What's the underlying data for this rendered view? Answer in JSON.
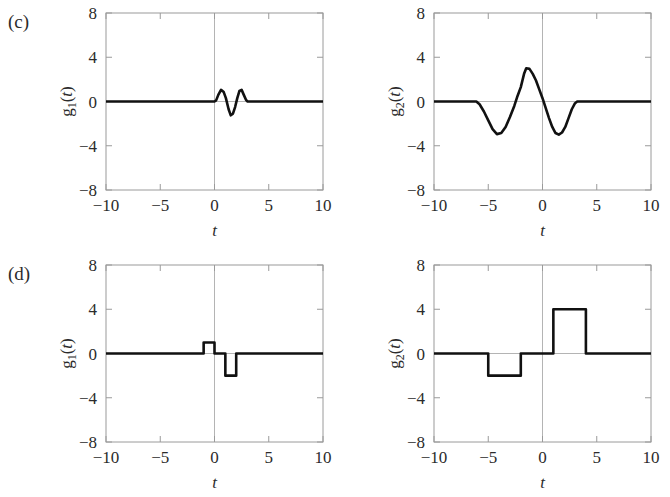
{
  "figure": {
    "background": "#ffffff",
    "curve_color": "#111111",
    "frame_color": "#9a9a9a",
    "zero_line_color": "#b4b4b4",
    "panels": [
      {
        "tag": "(c)",
        "plots": [
          {
            "id": "c-left",
            "ylabel_base": "g",
            "ylabel_sub": "1",
            "ylabel_arg": "(t)",
            "xlabel": "t",
            "box": {
              "x": 106,
              "y": 13,
              "w": 217,
              "h": 177
            },
            "tag_pos": {
              "x": 8,
              "y": 28
            },
            "chart_data": {
              "type": "line",
              "title": "",
              "xlabel": "t",
              "ylabel": "g1(t)",
              "xlim": [
                -10,
                10
              ],
              "ylim": [
                -8,
                8
              ],
              "xticks": [
                -10,
                -5,
                0,
                5,
                10
              ],
              "yticks": [
                -8,
                -4,
                0,
                4,
                8
              ],
              "xticklabels": [
                "−10",
                "−5",
                "0",
                "5",
                "10"
              ],
              "yticklabels": [
                "−8",
                "−4",
                "0",
                "4",
                "8"
              ],
              "grid": false,
              "legend": "none",
              "series": [
                {
                  "name": "g1(t)",
                  "points": [
                    [
                      -10,
                      0
                    ],
                    [
                      -1,
                      0
                    ],
                    [
                      -0.4,
                      0
                    ],
                    [
                      0,
                      0
                    ],
                    [
                      0.15,
                      0.1
                    ],
                    [
                      0.35,
                      0.6
                    ],
                    [
                      0.6,
                      1.05
                    ],
                    [
                      0.85,
                      0.85
                    ],
                    [
                      1.05,
                      0.3
                    ],
                    [
                      1.3,
                      -0.7
                    ],
                    [
                      1.5,
                      -1.25
                    ],
                    [
                      1.7,
                      -1.1
                    ],
                    [
                      1.9,
                      -0.5
                    ],
                    [
                      2.1,
                      0.3
                    ],
                    [
                      2.3,
                      0.95
                    ],
                    [
                      2.5,
                      1.05
                    ],
                    [
                      2.7,
                      0.6
                    ],
                    [
                      2.9,
                      0.15
                    ],
                    [
                      3.05,
                      0
                    ],
                    [
                      5,
                      0
                    ],
                    [
                      10,
                      0
                    ]
                  ]
                }
              ]
            }
          },
          {
            "id": "c-right",
            "ylabel_base": "g",
            "ylabel_sub": "2",
            "ylabel_arg": "(t)",
            "xlabel": "t",
            "box": {
              "x": 434,
              "y": 13,
              "w": 217,
              "h": 177
            },
            "chart_data": {
              "type": "line",
              "title": "",
              "xlabel": "t",
              "ylabel": "g2(t)",
              "xlim": [
                -10,
                10
              ],
              "ylim": [
                -8,
                8
              ],
              "xticks": [
                -10,
                -5,
                0,
                5,
                10
              ],
              "yticks": [
                -8,
                -4,
                0,
                4,
                8
              ],
              "xticklabels": [
                "−10",
                "−5",
                "0",
                "5",
                "10"
              ],
              "yticklabels": [
                "−8",
                "−4",
                "0",
                "4",
                "8"
              ],
              "grid": false,
              "legend": "none",
              "series": [
                {
                  "name": "g2(t)",
                  "points": [
                    [
                      -10,
                      0
                    ],
                    [
                      -6.1,
                      0
                    ],
                    [
                      -5.8,
                      -0.25
                    ],
                    [
                      -5.4,
                      -0.9
                    ],
                    [
                      -5.0,
                      -1.7
                    ],
                    [
                      -4.6,
                      -2.5
                    ],
                    [
                      -4.2,
                      -2.95
                    ],
                    [
                      -3.8,
                      -2.85
                    ],
                    [
                      -3.4,
                      -2.3
                    ],
                    [
                      -3.0,
                      -1.4
                    ],
                    [
                      -2.6,
                      -0.4
                    ],
                    [
                      -2.3,
                      0.5
                    ],
                    [
                      -2.0,
                      1.3
                    ],
                    [
                      -1.7,
                      2.5
                    ],
                    [
                      -1.5,
                      3.0
                    ],
                    [
                      -1.2,
                      2.95
                    ],
                    [
                      -0.9,
                      2.5
                    ],
                    [
                      -0.6,
                      1.9
                    ],
                    [
                      -0.3,
                      1.1
                    ],
                    [
                      0,
                      0.3
                    ],
                    [
                      0.3,
                      -0.6
                    ],
                    [
                      0.6,
                      -1.5
                    ],
                    [
                      0.9,
                      -2.3
                    ],
                    [
                      1.2,
                      -2.85
                    ],
                    [
                      1.5,
                      -3.0
                    ],
                    [
                      1.8,
                      -2.8
                    ],
                    [
                      2.1,
                      -2.3
                    ],
                    [
                      2.4,
                      -1.5
                    ],
                    [
                      2.7,
                      -0.7
                    ],
                    [
                      3.0,
                      -0.15
                    ],
                    [
                      3.2,
                      0
                    ],
                    [
                      5,
                      0
                    ],
                    [
                      10,
                      0
                    ]
                  ]
                }
              ]
            }
          }
        ]
      },
      {
        "tag": "(d)",
        "plots": [
          {
            "id": "d-left",
            "ylabel_base": "g",
            "ylabel_sub": "1",
            "ylabel_arg": "(t)",
            "xlabel": "t",
            "box": {
              "x": 106,
              "y": 265,
              "w": 217,
              "h": 177
            },
            "tag_pos": {
              "x": 8,
              "y": 280
            },
            "chart_data": {
              "type": "line",
              "title": "",
              "xlabel": "t",
              "ylabel": "g1(t)",
              "xlim": [
                -10,
                10
              ],
              "ylim": [
                -8,
                8
              ],
              "xticks": [
                -10,
                -5,
                0,
                5,
                10
              ],
              "yticks": [
                -8,
                -4,
                0,
                4,
                8
              ],
              "xticklabels": [
                "−10",
                "−5",
                "0",
                "5",
                "10"
              ],
              "yticklabels": [
                "−8",
                "−4",
                "0",
                "4",
                "8"
              ],
              "grid": false,
              "legend": "none",
              "series": [
                {
                  "name": "g1(t)",
                  "points": [
                    [
                      -10,
                      0
                    ],
                    [
                      -1,
                      0
                    ],
                    [
                      -1,
                      1
                    ],
                    [
                      0,
                      1
                    ],
                    [
                      0,
                      0
                    ],
                    [
                      1,
                      0
                    ],
                    [
                      1,
                      -2
                    ],
                    [
                      2,
                      -2
                    ],
                    [
                      2,
                      0
                    ],
                    [
                      10,
                      0
                    ]
                  ]
                }
              ]
            }
          },
          {
            "id": "d-right",
            "ylabel_base": "g",
            "ylabel_sub": "2",
            "ylabel_arg": "(t)",
            "xlabel": "t",
            "box": {
              "x": 434,
              "y": 265,
              "w": 217,
              "h": 177
            },
            "chart_data": {
              "type": "line",
              "title": "",
              "xlabel": "t",
              "ylabel": "g2(t)",
              "xlim": [
                -10,
                10
              ],
              "ylim": [
                -8,
                8
              ],
              "xticks": [
                -10,
                -5,
                0,
                5,
                10
              ],
              "yticks": [
                -8,
                -4,
                0,
                4,
                8
              ],
              "xticklabels": [
                "−10",
                "−5",
                "0",
                "5",
                "10"
              ],
              "yticklabels": [
                "−8",
                "−4",
                "0",
                "4",
                "8"
              ],
              "grid": false,
              "legend": "none",
              "series": [
                {
                  "name": "g2(t)",
                  "points": [
                    [
                      -10,
                      0
                    ],
                    [
                      -5,
                      0
                    ],
                    [
                      -5,
                      -2
                    ],
                    [
                      -2,
                      -2
                    ],
                    [
                      -2,
                      0
                    ],
                    [
                      1,
                      0
                    ],
                    [
                      1,
                      4
                    ],
                    [
                      4,
                      4
                    ],
                    [
                      4,
                      0
                    ],
                    [
                      10,
                      0
                    ]
                  ]
                }
              ]
            }
          }
        ]
      }
    ]
  },
  "chart_data": [
    {
      "type": "line",
      "panel": "(c)",
      "name": "g1(t) modulated pulse",
      "title": "",
      "xlabel": "t",
      "ylabel": "g1(t)",
      "xlim": [
        -10,
        10
      ],
      "ylim": [
        -8,
        8
      ],
      "xticks": [
        -10,
        -5,
        0,
        5,
        10
      ],
      "yticks": [
        -8,
        -4,
        0,
        4,
        8
      ],
      "grid": false,
      "legend": "none",
      "description": "Zero everywhere except a short oscillation between t=0 and t=3: peak +1 near t=0.6, trough -1.25 near t=1.5, peak +1 near t=2.5.",
      "x": [
        -10,
        0,
        0.6,
        1.5,
        2.5,
        3,
        10
      ],
      "y": [
        0,
        0,
        1.05,
        -1.25,
        1.05,
        0,
        0
      ]
    },
    {
      "type": "line",
      "panel": "(c)",
      "name": "g2(t) modulated pulse",
      "title": "",
      "xlabel": "t",
      "ylabel": "g2(t)",
      "xlim": [
        -10,
        10
      ],
      "ylim": [
        -8,
        8
      ],
      "xticks": [
        -10,
        -5,
        0,
        5,
        10
      ],
      "yticks": [
        -8,
        -4,
        0,
        4,
        8
      ],
      "grid": false,
      "legend": "none",
      "description": "Zero until t=-6, trough -3 near t=-4.2, peak +3 near t=-1.5, trough -3 near t=1.5, back to zero at t=3.2.",
      "x": [
        -10,
        -6,
        -4.2,
        -1.5,
        1.5,
        3.2,
        10
      ],
      "y": [
        0,
        0,
        -3,
        3,
        -3,
        0,
        0
      ]
    },
    {
      "type": "line",
      "panel": "(d)",
      "name": "g1(t) rectangular pulses",
      "title": "",
      "xlabel": "t",
      "ylabel": "g1(t)",
      "xlim": [
        -10,
        10
      ],
      "ylim": [
        -8,
        8
      ],
      "xticks": [
        -10,
        -5,
        0,
        5,
        10
      ],
      "yticks": [
        -8,
        -4,
        0,
        4,
        8
      ],
      "grid": false,
      "legend": "none",
      "description": "Piecewise constant: 0 for t<-1, +1 for -1<t<0, 0 for 0<t<1, -2 for 1<t<2, 0 for t>2.",
      "segments": [
        {
          "from": -10,
          "to": -1,
          "value": 0
        },
        {
          "from": -1,
          "to": 0,
          "value": 1
        },
        {
          "from": 0,
          "to": 1,
          "value": 0
        },
        {
          "from": 1,
          "to": 2,
          "value": -2
        },
        {
          "from": 2,
          "to": 10,
          "value": 0
        }
      ]
    },
    {
      "type": "line",
      "panel": "(d)",
      "name": "g2(t) rectangular pulses",
      "title": "",
      "xlabel": "t",
      "ylabel": "g2(t)",
      "xlim": [
        -10,
        10
      ],
      "ylim": [
        -8,
        8
      ],
      "xticks": [
        -10,
        -5,
        0,
        5,
        10
      ],
      "yticks": [
        -8,
        -4,
        0,
        4,
        8
      ],
      "grid": false,
      "legend": "none",
      "description": "Piecewise constant: 0 for t<-5, -2 for -5<t<-2, 0 for -2<t<1, +4 for 1<t<4, 0 for t>4.",
      "segments": [
        {
          "from": -10,
          "to": -5,
          "value": 0
        },
        {
          "from": -5,
          "to": -2,
          "value": -2
        },
        {
          "from": -2,
          "to": 1,
          "value": 0
        },
        {
          "from": 1,
          "to": 4,
          "value": 4
        },
        {
          "from": 4,
          "to": 10,
          "value": 0
        }
      ]
    }
  ]
}
